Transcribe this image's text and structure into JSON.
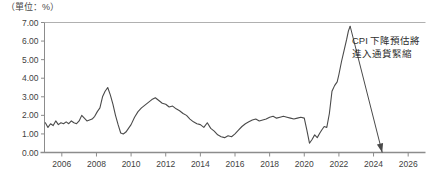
{
  "unit_label": "（單位：%）",
  "annotation": {
    "line1": "CPI 下降預估將",
    "line2": "進入通貨緊縮"
  },
  "colors": {
    "line": "#4a4a4a",
    "axis": "#8c8c8c",
    "frame": "#b0b0b0",
    "text": "#3a3a3a",
    "arrow": "#4a4a4a"
  },
  "chart_data": {
    "type": "line",
    "title": "",
    "subtitle": "",
    "xlabel": "",
    "ylabel": "（單位：%）",
    "grid": false,
    "legend": "none",
    "xlim": [
      2005.0,
      2027.0
    ],
    "ylim": [
      0.0,
      7.0
    ],
    "ytick_labels": [
      "0.00",
      "1.00",
      "2.00",
      "3.00",
      "4.00",
      "5.00",
      "6.00",
      "7.00"
    ],
    "ytick_values": [
      0,
      1,
      2,
      3,
      4,
      5,
      6,
      7
    ],
    "xtick_labels": [
      "2006",
      "2008",
      "2010",
      "2012",
      "2014",
      "2016",
      "2018",
      "2020",
      "2022",
      "2024",
      "2026"
    ],
    "xtick_values": [
      2006,
      2008,
      2010,
      2012,
      2014,
      2016,
      2018,
      2020,
      2022,
      2024,
      2026
    ],
    "series": [
      {
        "name": "CPI",
        "x": [
          2005.05,
          2005.2,
          2005.35,
          2005.5,
          2005.65,
          2005.8,
          2005.95,
          2006.1,
          2006.25,
          2006.4,
          2006.55,
          2006.7,
          2006.85,
          2007.0,
          2007.15,
          2007.3,
          2007.45,
          2007.6,
          2007.75,
          2007.9,
          2008.05,
          2008.2,
          2008.35,
          2008.5,
          2008.65,
          2008.8,
          2008.95,
          2009.1,
          2009.25,
          2009.4,
          2009.55,
          2009.7,
          2009.85,
          2010.0,
          2010.2,
          2010.4,
          2010.6,
          2010.8,
          2011.0,
          2011.2,
          2011.4,
          2011.6,
          2011.8,
          2012.0,
          2012.2,
          2012.4,
          2012.6,
          2012.8,
          2013.0,
          2013.2,
          2013.4,
          2013.6,
          2013.8,
          2014.0,
          2014.2,
          2014.4,
          2014.6,
          2014.8,
          2015.0,
          2015.2,
          2015.4,
          2015.6,
          2015.8,
          2016.0,
          2016.2,
          2016.4,
          2016.6,
          2016.8,
          2017.0,
          2017.2,
          2017.4,
          2017.6,
          2017.8,
          2018.0,
          2018.2,
          2018.4,
          2018.6,
          2018.8,
          2019.0,
          2019.2,
          2019.4,
          2019.6,
          2019.8,
          2020.0,
          2020.15,
          2020.3,
          2020.45,
          2020.6,
          2020.75,
          2020.9,
          2021.0,
          2021.15,
          2021.3,
          2021.45,
          2021.6,
          2021.75,
          2021.9,
          2022.0,
          2022.15,
          2022.3,
          2022.45,
          2022.55,
          2022.65
        ],
        "y": [
          1.6,
          1.35,
          1.55,
          1.45,
          1.7,
          1.5,
          1.6,
          1.55,
          1.65,
          1.55,
          1.7,
          1.6,
          1.55,
          1.7,
          2.0,
          1.85,
          1.7,
          1.75,
          1.8,
          1.95,
          2.2,
          2.4,
          3.0,
          3.3,
          3.5,
          3.1,
          2.6,
          2.0,
          1.5,
          1.05,
          1.0,
          1.1,
          1.3,
          1.5,
          1.9,
          2.2,
          2.4,
          2.55,
          2.7,
          2.85,
          2.95,
          2.8,
          2.65,
          2.6,
          2.45,
          2.5,
          2.35,
          2.25,
          2.1,
          2.0,
          1.8,
          1.65,
          1.55,
          1.5,
          1.35,
          1.6,
          1.3,
          1.15,
          0.95,
          0.85,
          0.8,
          0.9,
          0.85,
          1.0,
          1.2,
          1.4,
          1.55,
          1.65,
          1.75,
          1.8,
          1.7,
          1.75,
          1.8,
          1.9,
          1.95,
          1.85,
          1.9,
          1.95,
          1.9,
          1.85,
          1.8,
          1.85,
          1.9,
          1.85,
          1.2,
          0.5,
          0.7,
          0.95,
          0.8,
          1.05,
          1.2,
          1.4,
          1.35,
          2.1,
          3.3,
          3.6,
          3.8,
          4.2,
          4.9,
          5.5,
          6.1,
          6.55,
          6.8
        ]
      }
    ],
    "annotations": [
      {
        "text_line1": "CPI 下降預估將",
        "text_line2": "進入通貨緊縮",
        "arrow_from": {
          "x": 2022.65,
          "y": 6.8
        },
        "arrow_to": {
          "x": 2024.5,
          "y": 0.0
        }
      }
    ]
  }
}
